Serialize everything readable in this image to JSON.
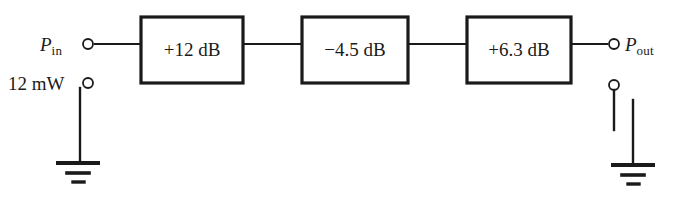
{
  "diagram": {
    "type": "schematic",
    "background_color": "#ffffff",
    "line_color": "#1a1a1a",
    "blocks": [
      {
        "id": "stage-1",
        "label": "+12 dB",
        "gain_db": 12,
        "kind": "amplifier",
        "x": 141,
        "y": 17,
        "width": 102,
        "height": 66
      },
      {
        "id": "stage-2",
        "label": "−4.5 dB",
        "gain_db": -4.5,
        "kind": "attenuator",
        "x": 302,
        "y": 17,
        "width": 106,
        "height": 66
      },
      {
        "id": "stage-3",
        "label": "+6.3 dB",
        "gain_db": 6.3,
        "kind": "amplifier",
        "x": 467,
        "y": 17,
        "width": 104,
        "height": 66
      }
    ],
    "ports": [
      {
        "id": "p-in",
        "symbol": "P",
        "subscript": "in",
        "side": "left",
        "terminal_x": 88,
        "terminal_y": 44
      },
      {
        "id": "p-out",
        "symbol": "P",
        "subscript": "out",
        "side": "right",
        "terminal_x": 614,
        "terminal_y": 44
      }
    ],
    "source": {
      "id": "input-power-source",
      "label": "12 mW",
      "value": 12,
      "unit": "mW",
      "terminal_x": 88,
      "terminal_y": 83
    },
    "return_terminal": {
      "id": "output-return",
      "terminal_x": 614,
      "terminal_y": 85
    },
    "grounds": [
      {
        "id": "ground-left",
        "x": 78,
        "y": 163
      },
      {
        "id": "ground-right",
        "x": 633,
        "y": 165
      }
    ]
  }
}
